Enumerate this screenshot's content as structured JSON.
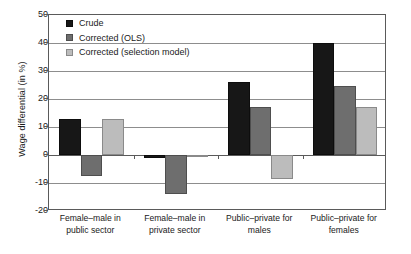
{
  "chart_data": {
    "type": "bar",
    "title": "",
    "xlabel": "",
    "ylabel": "Wage differential (in %)",
    "ylim": [
      -20,
      50
    ],
    "yticks": [
      50,
      40,
      30,
      20,
      10,
      0,
      -10,
      -20
    ],
    "ytick_labels": [
      "50",
      "40",
      "30",
      "20",
      "10",
      "0",
      "-10",
      "-20"
    ],
    "grid": true,
    "legend_position": "upper-left",
    "categories": [
      "Female–male in public sector",
      "Female–male in private sector",
      "Public–private for males",
      "Public–private for females"
    ],
    "category_lines": [
      [
        "Female–male in",
        "public sector"
      ],
      [
        "Female–male in",
        "private sector"
      ],
      [
        "Public–private for",
        "males"
      ],
      [
        "Public–private for",
        "females"
      ]
    ],
    "series": [
      {
        "name": "Crude",
        "color": "#171717",
        "values": [
          13,
          -1,
          26,
          40
        ]
      },
      {
        "name": "Corrected (OLS)",
        "color": "#6e6e6e",
        "values": [
          -7.5,
          -14,
          17,
          24.5
        ]
      },
      {
        "name": "Corrected (selection model)",
        "color": "#bcbcbc",
        "values": [
          13,
          -0.3,
          -8.5,
          17
        ]
      }
    ]
  },
  "legend": {
    "items": [
      {
        "label": "Crude"
      },
      {
        "label": "Corrected (OLS)"
      },
      {
        "label": "Corrected (selection model)"
      }
    ]
  },
  "colors": {
    "crude": "#171717",
    "ols": "#6e6e6e",
    "selection": "#bcbcbc",
    "axis": "#5a5a5a",
    "grid": "#8d8d8d",
    "background": "#ffffff"
  }
}
